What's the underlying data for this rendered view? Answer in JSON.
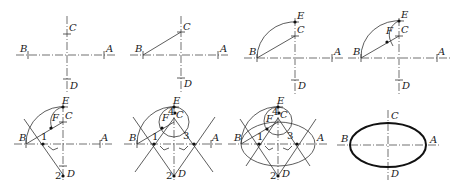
{
  "figure": {
    "panels": [
      {
        "step": 1,
        "labels": {
          "A": "A",
          "B": "B",
          "C": "C",
          "D": "D"
        }
      },
      {
        "step": 2,
        "labels": {
          "A": "A",
          "B": "B",
          "C": "C",
          "D": "D"
        }
      },
      {
        "step": 3,
        "labels": {
          "A": "A",
          "B": "B",
          "C": "C",
          "D": "D",
          "E": "E"
        }
      },
      {
        "step": 4,
        "labels": {
          "A": "A",
          "B": "B",
          "C": "C",
          "D": "D",
          "E": "E",
          "F": "F"
        }
      },
      {
        "step": 5,
        "labels": {
          "A": "A",
          "B": "B",
          "C": "C",
          "D": "D",
          "E": "E",
          "F": "F"
        },
        "numbers": {
          "n1": "1",
          "n2": "2"
        }
      },
      {
        "step": 6,
        "labels": {
          "A": "A",
          "B": "B",
          "C": "C",
          "D": "D",
          "E": "E",
          "F": "F"
        },
        "numbers": {
          "n1": "1",
          "n2": "2",
          "n3": "3",
          "n4": "4"
        }
      },
      {
        "step": 7,
        "labels": {
          "A": "A",
          "B": "B",
          "C": "C",
          "D": "D",
          "E": "E",
          "F": "F"
        },
        "numbers": {
          "n1": "1",
          "n2": "2",
          "n3": "3",
          "n4": "4"
        }
      },
      {
        "step": 8,
        "labels": {
          "A": "A",
          "B": "B",
          "C": "C",
          "D": "D"
        }
      }
    ]
  }
}
